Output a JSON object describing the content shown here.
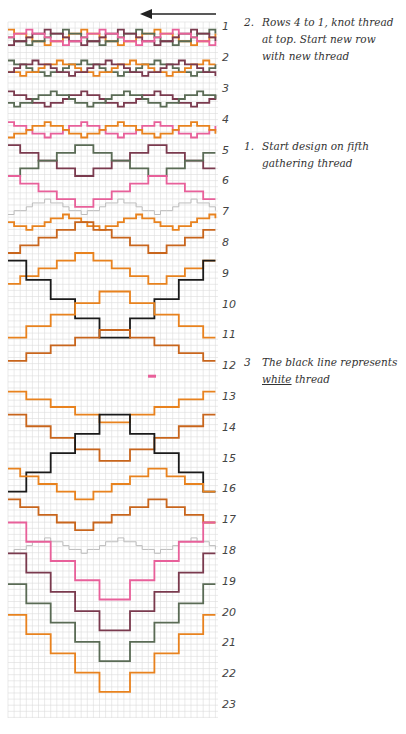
{
  "diagram": {
    "type": "smocking-chart",
    "direction_arrow": "arrow-left-icon",
    "grid": {
      "left": 8,
      "top": 22,
      "right": 218,
      "bottom": 718,
      "cell": 6.1,
      "color": "#dcdcdc"
    },
    "row_pitch": 30.8,
    "row_labels": [
      "1",
      "2",
      "3",
      "4",
      "5",
      "6",
      "7",
      "8",
      "9",
      "10",
      "11",
      "12",
      "13",
      "14",
      "15",
      "16",
      "17",
      "18",
      "19",
      "20",
      "21",
      "22",
      "23"
    ],
    "colors": {
      "orange": "#e8821e",
      "dark_orange": "#c8651c",
      "green": "#5a6b55",
      "plum": "#7a3a4e",
      "pink": "#e8609a",
      "black": "#1a1a1a",
      "grey": "#bdbdbd"
    },
    "threads": [
      {
        "color": "orange",
        "base": 1.0,
        "amp": 0.5,
        "period": 12,
        "phase": 0
      },
      {
        "color": "green",
        "base": 1.0,
        "amp": 0.5,
        "period": 12,
        "phase": 3
      },
      {
        "color": "plum",
        "base": 1.0,
        "amp": 0.5,
        "period": 12,
        "phase": 6
      },
      {
        "color": "pink",
        "base": 1.0,
        "amp": 0.5,
        "period": 12,
        "phase": 9
      },
      {
        "color": "green",
        "base": 2.0,
        "amp": 0.5,
        "period": 12,
        "phase": 0
      },
      {
        "color": "orange",
        "base": 2.0,
        "amp": 0.5,
        "period": 12,
        "phase": 4
      },
      {
        "color": "plum",
        "base": 2.0,
        "amp": 0.5,
        "period": 12,
        "phase": 8
      },
      {
        "color": "plum",
        "base": 3.0,
        "amp": 0.5,
        "period": 12,
        "phase": 0
      },
      {
        "color": "green",
        "base": 3.0,
        "amp": 0.5,
        "period": 12,
        "phase": 5
      },
      {
        "color": "pink",
        "base": 4.0,
        "amp": 0.5,
        "period": 12,
        "phase": 0
      },
      {
        "color": "orange",
        "base": 4.0,
        "amp": 0.5,
        "period": 12,
        "phase": 6
      },
      {
        "color": "plum",
        "base": 5.0,
        "amp": 1.0,
        "period": 24,
        "phase": 0
      },
      {
        "color": "green",
        "base": 5.0,
        "amp": 1.0,
        "period": 24,
        "phase": 12
      },
      {
        "color": "pink",
        "base": 6.0,
        "amp": 1.0,
        "period": 24,
        "phase": 0
      },
      {
        "color": "grey",
        "base": 6.5,
        "amp": 0.5,
        "period": 12,
        "phase": 6
      },
      {
        "color": "orange",
        "base": 7.0,
        "amp": 0.5,
        "period": 12,
        "phase": 3
      },
      {
        "color": "dark_orange",
        "base": 7.5,
        "amp": 1.0,
        "period": 24,
        "phase": 12
      },
      {
        "color": "orange",
        "base": 8.5,
        "amp": 1.0,
        "period": 24,
        "phase": 12
      },
      {
        "color": "black",
        "base": 9.5,
        "amp": 2.5,
        "period": 34,
        "phase": 0
      },
      {
        "color": "orange",
        "base": 10.0,
        "amp": 1.5,
        "period": 34,
        "phase": 17
      },
      {
        "color": "dark_orange",
        "base": 11.0,
        "amp": 1.0,
        "period": 34,
        "phase": 17
      },
      {
        "color": "orange",
        "base": 13.0,
        "amp": -1.0,
        "period": 34,
        "phase": 17
      },
      {
        "color": "dark_orange",
        "base": 14.0,
        "amp": -1.5,
        "period": 34,
        "phase": 17
      },
      {
        "color": "black",
        "base": 14.5,
        "amp": -2.5,
        "period": 34,
        "phase": 0
      },
      {
        "color": "orange",
        "base": 15.5,
        "amp": -1.0,
        "period": 24,
        "phase": 12
      },
      {
        "color": "dark_orange",
        "base": 16.5,
        "amp": -1.0,
        "period": 24,
        "phase": 12
      },
      {
        "color": "grey",
        "base": 17.5,
        "amp": 0.5,
        "period": 12,
        "phase": 6
      },
      {
        "color": "pink",
        "base": 18.0,
        "amp": 2.5,
        "period": 34,
        "phase": 0
      },
      {
        "color": "plum",
        "base": 19.0,
        "amp": 2.5,
        "period": 34,
        "phase": 0
      },
      {
        "color": "green",
        "base": 20.0,
        "amp": 2.5,
        "period": 34,
        "phase": 0
      },
      {
        "color": "orange",
        "base": 21.0,
        "amp": 2.5,
        "period": 34,
        "phase": 0
      }
    ],
    "center_mark": {
      "color": "pink",
      "row": 12
    }
  },
  "notes": [
    {
      "row": 1,
      "num": "2.",
      "line1": "Rows 4 to 1, knot thread",
      "line2": "at top. Start new row",
      "line3": "with new thread"
    },
    {
      "row": 5,
      "num": "1.",
      "line1": "Start design on fifth",
      "line2": "gathering thread"
    },
    {
      "row": 12,
      "num": "3",
      "line1": "The black line represents",
      "line2_underlined": "white",
      "line2_rest": " thread"
    }
  ]
}
